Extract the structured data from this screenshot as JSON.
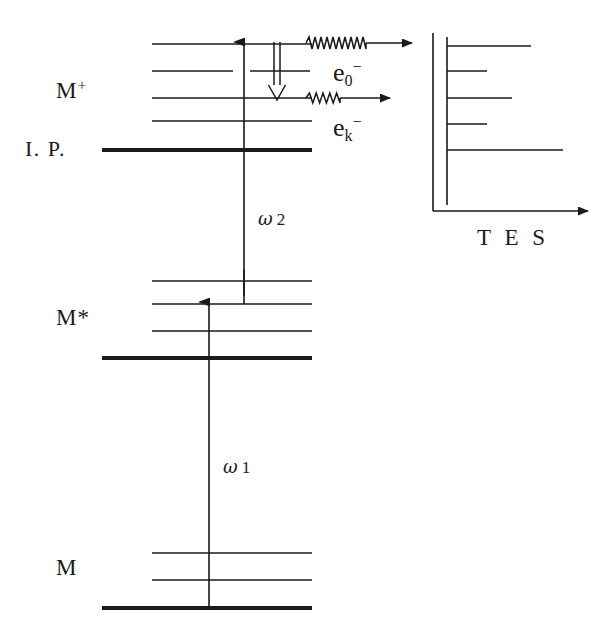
{
  "figure": {
    "background": "#ffffff",
    "ink": "#1a1a1a",
    "width": 611,
    "height": 641
  },
  "labels": {
    "ion_state": "M",
    "ion_state_charge": "+",
    "ionization_potential": "I. P.",
    "excited_state": "M*",
    "ground_state": "M",
    "electron_zero": "e",
    "electron_zero_sub": "0",
    "electron_zero_sup": "−",
    "electron_k": "e",
    "electron_k_sub": "k",
    "electron_k_sup": "−",
    "photon_two_symbol": "ω",
    "photon_two_index": "2",
    "photon_one_symbol": "ω",
    "photon_one_index": "1",
    "spectrum_axis": "T E S"
  },
  "manifolds": {
    "ion": {
      "name": "M+ ion manifold",
      "thick_level": {
        "y": 150,
        "x1": 102,
        "x2": 312,
        "width": 4.2
      },
      "thin_levels": [
        {
          "y": 44,
          "x1": 152,
          "x2": 312,
          "width": 1.3
        },
        {
          "y": 71,
          "x1": 152,
          "x2": 310,
          "width": 1.6
        },
        {
          "y": 98,
          "x1": 152,
          "x2": 312,
          "width": 1.3
        },
        {
          "y": 121,
          "x1": 152,
          "x2": 312,
          "width": 1.3
        }
      ]
    },
    "excited": {
      "name": "M* excited manifold",
      "thick_level": {
        "y": 358,
        "x1": 102,
        "x2": 312,
        "width": 4.2
      },
      "thin_levels": [
        {
          "y": 281,
          "x1": 152,
          "x2": 312,
          "width": 1.3
        },
        {
          "y": 304,
          "x1": 152,
          "x2": 312,
          "width": 1.3
        },
        {
          "y": 331,
          "x1": 152,
          "x2": 312,
          "width": 1.3
        }
      ]
    },
    "ground": {
      "name": "M ground manifold",
      "thick_level": {
        "y": 608,
        "x1": 102,
        "x2": 312,
        "width": 4.2
      },
      "thin_levels": [
        {
          "y": 553,
          "x1": 152,
          "x2": 312,
          "width": 1.3
        },
        {
          "y": 580,
          "x1": 152,
          "x2": 312,
          "width": 1.3
        }
      ]
    }
  },
  "transitions": {
    "omega1_arrow": {
      "x": 209,
      "y_tail": 608,
      "y_head": 302
    },
    "omega2_arrow": {
      "x": 244,
      "y_tail": 304,
      "y_head": 42,
      "dash_top": 270,
      "dash_bottom": 296
    },
    "autoionization_arrow": {
      "x": 277,
      "y_tail": 42,
      "y_head": 100,
      "style": "double-line-down"
    }
  },
  "electron_escapes": [
    {
      "name": "e0-",
      "y": 43,
      "wave_x1": 306,
      "wave_x2": 366,
      "line_x2": 412,
      "zigzags": 10,
      "amplitude": 6,
      "label_x": 333,
      "label_y": 58
    },
    {
      "name": "ek-",
      "y": 98,
      "wave_x1": 306,
      "wave_x2": 340,
      "line_x2": 390,
      "zigzags": 5,
      "amplitude": 5,
      "label_x": 333,
      "label_y": 113
    }
  ],
  "tes_panel": {
    "name": "threshold electron spectrum",
    "outer_axis_x": 433,
    "inner_axis_x": 447,
    "axis_top": 33,
    "axis_bottom": 211,
    "baseline_y": 211,
    "baseline_x2": 588,
    "bars": [
      {
        "y": 46,
        "x2": 531,
        "label": "bar-1"
      },
      {
        "y": 71,
        "x2": 487,
        "label": "bar-2"
      },
      {
        "y": 98,
        "x2": 512,
        "label": "bar-3"
      },
      {
        "y": 124,
        "x2": 487,
        "label": "bar-4"
      },
      {
        "y": 150,
        "x2": 563,
        "label": "bar-5"
      }
    ],
    "axis_label_x": 477,
    "axis_label_y": 225
  },
  "label_positions": {
    "ion_state": {
      "x": 56,
      "y": 76
    },
    "ionization_potential": {
      "x": 25,
      "y": 136
    },
    "excited_state": {
      "x": 56,
      "y": 305
    },
    "ground_state": {
      "x": 56,
      "y": 555
    },
    "omega2": {
      "x": 258,
      "y": 208
    },
    "omega1": {
      "x": 223,
      "y": 456
    }
  }
}
